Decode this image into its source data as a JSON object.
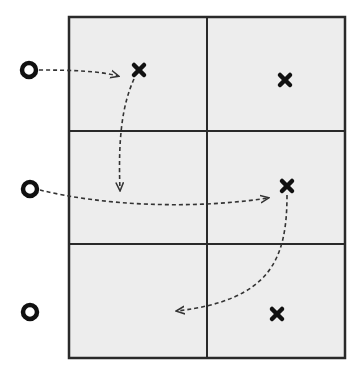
{
  "diagram": {
    "type": "grid-movement-diagram",
    "grid": {
      "rows": 3,
      "cols": 2,
      "x": 69,
      "y": 17,
      "width": 276,
      "height": 341,
      "col_divider_x": 207,
      "row_divider_y": [
        131,
        244
      ],
      "fill_color": "#ededed",
      "line_color": "#2a2a2a"
    },
    "circles": [
      {
        "id": "o1",
        "cx": 29,
        "cy": 70,
        "r": 7
      },
      {
        "id": "o2",
        "cx": 30,
        "cy": 189,
        "r": 7
      },
      {
        "id": "o3",
        "cx": 30,
        "cy": 312,
        "r": 7
      }
    ],
    "crosses": [
      {
        "id": "x1",
        "cx": 139,
        "cy": 70,
        "size": 5
      },
      {
        "id": "x2",
        "cx": 285,
        "cy": 80,
        "size": 5
      },
      {
        "id": "x3",
        "cx": 287,
        "cy": 186,
        "size": 5
      },
      {
        "id": "x4",
        "cx": 277,
        "cy": 314,
        "size": 5
      }
    ],
    "arrows": [
      {
        "id": "a1",
        "from": "o1",
        "to_point": [
          118,
          76
        ],
        "d": "M 39 70 C 70 70, 100 71, 118 76"
      },
      {
        "id": "a2",
        "from": "x1",
        "to_point": [
          120,
          190
        ],
        "d": "M 134 79 C 122 105, 118 140, 120 190"
      },
      {
        "id": "a3",
        "from": "o2",
        "to_point": [
          268,
          198
        ],
        "d": "M 40 190 C 100 205, 190 210, 268 198"
      },
      {
        "id": "a4",
        "from": "x3",
        "to_point": [
          177,
          311
        ],
        "d": "M 287 195 C 287 260, 270 300, 177 311"
      }
    ],
    "colors": {
      "marker": "#111111",
      "arrow": "#333333"
    }
  }
}
